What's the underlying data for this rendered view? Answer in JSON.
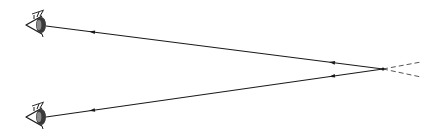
{
  "diagram": {
    "type": "optics-ray-diagram",
    "colors": {
      "background": "#ffffff",
      "stroke": "#1a1a1a",
      "dashed": "#555555"
    },
    "convergence_point": {
      "x": 383,
      "y": 69
    },
    "eyes": [
      {
        "id": "top-eye",
        "x": 40,
        "y": 25,
        "facing": "right"
      },
      {
        "id": "bottom-eye",
        "x": 40,
        "y": 117,
        "facing": "right"
      }
    ],
    "rays": [
      {
        "id": "top-ray",
        "from": {
          "x": 383,
          "y": 69
        },
        "to": {
          "x": 46,
          "y": 26
        },
        "arrows_at_x": [
          332,
          92
        ],
        "direction": "toward-eye"
      },
      {
        "id": "bottom-ray",
        "from": {
          "x": 383,
          "y": 69
        },
        "to": {
          "x": 46,
          "y": 117
        },
        "arrows_at_x": [
          332,
          92
        ],
        "direction": "toward-eye"
      }
    ],
    "dashed_extensions": [
      {
        "id": "upper-dashed",
        "from": {
          "x": 383,
          "y": 69
        },
        "to": {
          "x": 421,
          "y": 62
        }
      },
      {
        "id": "lower-dashed",
        "from": {
          "x": 383,
          "y": 69
        },
        "to": {
          "x": 421,
          "y": 77
        }
      }
    ]
  }
}
